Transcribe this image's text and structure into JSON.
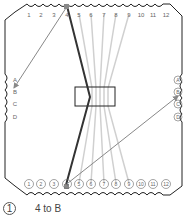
{
  "diagram": {
    "top_labels": [
      "1",
      "2",
      "3",
      "4",
      "5",
      "6",
      "7",
      "8",
      "9",
      "10",
      "11",
      "12"
    ],
    "left_labels": [
      "A",
      "B",
      "C",
      "D"
    ],
    "right_labels": [
      "A",
      "B",
      "C",
      "D"
    ],
    "bottom_labels": [
      "1",
      "2",
      "3",
      "4",
      "5",
      "6",
      "7",
      "8",
      "9",
      "10",
      "11",
      "12"
    ],
    "highlighted_pin": "4",
    "colors": {
      "outline": "#222222",
      "highlight_wire": "#333333",
      "other_wires": "#d0d0d0",
      "arrow": "#888888",
      "label": "#666666"
    }
  },
  "legend": {
    "step_number": "1",
    "step_text": "4 to B"
  }
}
